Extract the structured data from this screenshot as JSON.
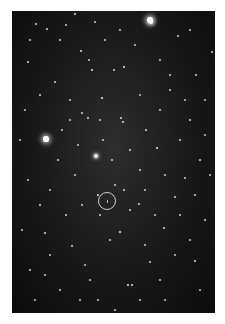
{
  "image": {
    "subject": "star field",
    "background_color": "#141414",
    "marker": {
      "shape": "circle",
      "center_x": 107,
      "center_y": 201,
      "radius": 9,
      "color": "#cfcfcf"
    }
  },
  "stars": [
    [
      150,
      20,
      3.4
    ],
    [
      151,
      22,
      2.6
    ],
    [
      46,
      139,
      3.2
    ],
    [
      96,
      156,
      2.2
    ],
    [
      102,
      98,
      1.8
    ],
    [
      92,
      70,
      1.8
    ],
    [
      81,
      51,
      1.6
    ],
    [
      75,
      14,
      1.5
    ],
    [
      36,
      24,
      1.3
    ],
    [
      47,
      29,
      1.4
    ],
    [
      124,
      67,
      1.6
    ],
    [
      114,
      70,
      1.3
    ],
    [
      89,
      60,
      1.2
    ],
    [
      121,
      118,
      1.5
    ],
    [
      157,
      148,
      1.8
    ],
    [
      123,
      122,
      1.4
    ],
    [
      120,
      232,
      1.8
    ],
    [
      128,
      285,
      1.6
    ],
    [
      132,
      285,
      1.6
    ],
    [
      195,
      261,
      1.6
    ],
    [
      45,
      233,
      1.5
    ],
    [
      164,
      228,
      1.4
    ],
    [
      139,
      204,
      1.5
    ],
    [
      130,
      210,
      1.3
    ],
    [
      175,
      197,
      1.3
    ],
    [
      212,
      52,
      1.3
    ],
    [
      178,
      36,
      1.2
    ],
    [
      60,
      40,
      1.2
    ],
    [
      28,
      62,
      1.1
    ],
    [
      55,
      82,
      1.1
    ],
    [
      70,
      100,
      1.0
    ],
    [
      82,
      113,
      1.2
    ],
    [
      88,
      118,
      1.1
    ],
    [
      103,
      140,
      1.2
    ],
    [
      146,
      130,
      1.1
    ],
    [
      170,
      90,
      1.0
    ],
    [
      190,
      120,
      1.0
    ],
    [
      196,
      75,
      1.0
    ],
    [
      200,
      160,
      1.1
    ],
    [
      185,
      178,
      1.0
    ],
    [
      28,
      180,
      1.0
    ],
    [
      40,
      205,
      1.0
    ],
    [
      66,
      215,
      1.0
    ],
    [
      72,
      246,
      1.0
    ],
    [
      85,
      265,
      1.0
    ],
    [
      98,
      300,
      1.0
    ],
    [
      150,
      262,
      1.0
    ],
    [
      165,
      300,
      1.0
    ],
    [
      205,
      220,
      1.1
    ],
    [
      60,
      290,
      1.0
    ],
    [
      30,
      270,
      1.0
    ],
    [
      110,
      240,
      1.0
    ],
    [
      140,
      170,
      1.0
    ],
    [
      75,
      175,
      1.0
    ],
    [
      58,
      160,
      1.0
    ],
    [
      160,
      110,
      1.0
    ],
    [
      180,
      140,
      0.9
    ],
    [
      25,
      110,
      0.9
    ],
    [
      40,
      95,
      0.9
    ],
    [
      105,
      40,
      0.9
    ],
    [
      135,
      45,
      0.9
    ],
    [
      160,
      60,
      0.9
    ],
    [
      190,
      30,
      0.9
    ],
    [
      205,
      100,
      0.9
    ],
    [
      115,
      185,
      0.9
    ],
    [
      98,
      195,
      1.1
    ],
    [
      124,
      190,
      1.0
    ],
    [
      100,
      215,
      1.0
    ],
    [
      145,
      245,
      0.9
    ],
    [
      175,
      255,
      0.9
    ],
    [
      200,
      290,
      0.9
    ],
    [
      35,
      300,
      0.9
    ],
    [
      50,
      255,
      0.9
    ],
    [
      90,
      280,
      0.9
    ],
    [
      115,
      310,
      0.8
    ],
    [
      20,
      140,
      0.9
    ],
    [
      180,
      215,
      0.9
    ],
    [
      145,
      190,
      0.9
    ],
    [
      62,
      130,
      0.9
    ],
    [
      78,
      145,
      0.8
    ],
    [
      130,
      150,
      0.9
    ],
    [
      112,
      160,
      0.8
    ],
    [
      165,
      175,
      0.8
    ],
    [
      195,
      195,
      0.8
    ],
    [
      30,
      40,
      0.8
    ],
    [
      66,
      25,
      0.8
    ],
    [
      120,
      30,
      0.8
    ],
    [
      95,
      22,
      0.8
    ],
    [
      170,
      75,
      0.8
    ],
    [
      185,
      100,
      0.8
    ],
    [
      140,
      95,
      0.8
    ],
    [
      70,
      120,
      0.8
    ],
    [
      50,
      190,
      0.8
    ],
    [
      82,
      205,
      0.8
    ],
    [
      155,
      215,
      0.8
    ],
    [
      190,
      240,
      0.8
    ],
    [
      160,
      280,
      0.8
    ],
    [
      140,
      300,
      0.8
    ],
    [
      80,
      300,
      0.8
    ],
    [
      45,
      275,
      0.8
    ],
    [
      22,
      230,
      0.8
    ],
    [
      205,
      135,
      0.8
    ],
    [
      210,
      175,
      0.8
    ],
    [
      100,
      120,
      0.8
    ]
  ]
}
